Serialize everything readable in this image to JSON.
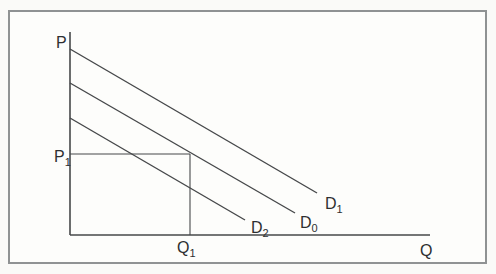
{
  "figure": {
    "colors": {
      "line": "#46484a",
      "frame": "#8f9293",
      "text": "#2d2f31",
      "background": "#fafaf8",
      "paper": "#fdfdfb"
    }
  },
  "chart_data": {
    "type": "line",
    "xlabel": "Q",
    "ylabel": "P",
    "legend": "none",
    "grid": false,
    "x_axis": {
      "label": "Q",
      "label_pos": [
        420,
        243
      ]
    },
    "y_axis": {
      "label": "P",
      "label_pos": [
        56,
        35
      ]
    },
    "axes_px": {
      "origin": [
        70,
        235
      ],
      "x_end": [
        430,
        235
      ],
      "y_top": [
        70,
        32
      ]
    },
    "series": [
      {
        "name": "D1",
        "label_base": "D",
        "label_sub": "1",
        "meaning": "demand increase (shift right)",
        "from": [
          70,
          49
        ],
        "to": [
          317,
          193
        ],
        "label_pos": [
          325,
          196
        ]
      },
      {
        "name": "D0",
        "label_base": "D",
        "label_sub": "0",
        "meaning": "original demand",
        "from": [
          70,
          83
        ],
        "to": [
          295,
          213
        ],
        "label_pos": [
          300,
          215
        ]
      },
      {
        "name": "D2",
        "label_base": "D",
        "label_sub": "2",
        "meaning": "demand decrease (shift left)",
        "from": [
          70,
          118
        ],
        "to": [
          245,
          220
        ],
        "label_pos": [
          251,
          220
        ]
      }
    ],
    "reference_lines": [
      {
        "name": "P1",
        "label_base": "P",
        "label_sub": "1",
        "orientation": "horizontal",
        "from": [
          70,
          154
        ],
        "to": [
          190,
          154
        ],
        "label_pos": [
          54,
          149
        ]
      },
      {
        "name": "Q1",
        "label_base": "Q",
        "label_sub": "1",
        "orientation": "vertical",
        "from": [
          190,
          154
        ],
        "to": [
          190,
          235
        ],
        "label_pos": [
          177,
          240
        ]
      }
    ]
  }
}
